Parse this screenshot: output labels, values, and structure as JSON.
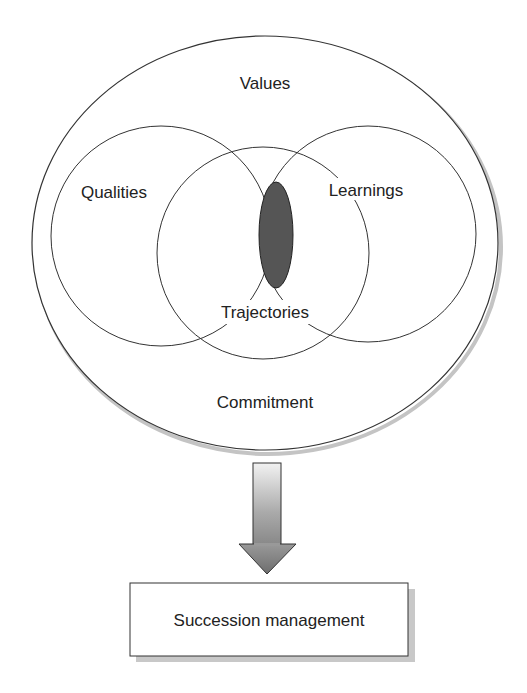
{
  "diagram": {
    "outer_label_top": "Values",
    "outer_label_bottom": "Commitment",
    "circles": [
      {
        "label": "Qualities"
      },
      {
        "label": "Learnings"
      },
      {
        "label": "Trajectories"
      }
    ],
    "intersection": {
      "fill": "#555555"
    },
    "arrow": {
      "direction": "down"
    },
    "result_box": {
      "label": "Succession management"
    }
  },
  "colors": {
    "stroke": "#333333",
    "shadow": "#bbbbbb",
    "intersection_fill": "#555555"
  }
}
